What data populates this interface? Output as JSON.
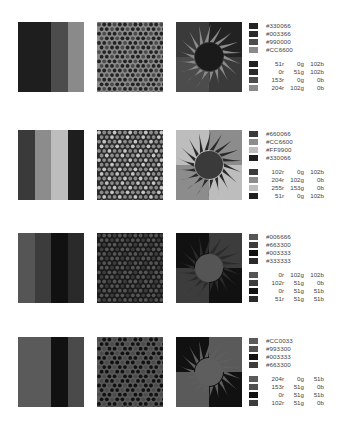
{
  "palettes": [
    {
      "top": 22,
      "stripes": [
        "#1e1e1e",
        "#1e1e1e",
        "#4c4c4c",
        "#8a8a8a"
      ],
      "pattern": {
        "bg": "#8a8a8a",
        "dot_a": "#222222",
        "dot_b": "#4a4a4a"
      },
      "sun": {
        "bg_tl": "#3a3a3a",
        "bg_tr": "#222222",
        "bg_bl": "#4c4c4c",
        "bg_br": "#3a3a3a",
        "rays": "#8a8a8a",
        "disc": "#1a1a1a"
      },
      "colors": [
        {
          "hex": "#330066",
          "r": "51r",
          "g": "0g",
          "b": "102b",
          "gray": "#222222"
        },
        {
          "hex": "#003366",
          "r": "0r",
          "g": "51g",
          "b": "102b",
          "gray": "#2a2a2a"
        },
        {
          "hex": "#990000",
          "r": "153r",
          "g": "0g",
          "b": "0b",
          "gray": "#4c4c4c"
        },
        {
          "hex": "#CC6600",
          "r": "204r",
          "g": "102g",
          "b": "0b",
          "gray": "#8a8a8a"
        }
      ]
    },
    {
      "top": 130,
      "stripes": [
        "#3a3a3a",
        "#8c8c8c",
        "#bdbdbd",
        "#1e1e1e"
      ],
      "pattern": {
        "bg": "#2a2a2a",
        "dot_a": "#8c8c8c",
        "dot_b": "#c4c4c4"
      },
      "sun": {
        "bg_tl": "#bdbdbd",
        "bg_tr": "#8c8c8c",
        "bg_bl": "#8c8c8c",
        "bg_br": "#bdbdbd",
        "rays": "#2a2a2a",
        "disc": "#3a3a3a"
      },
      "colors": [
        {
          "hex": "#660066",
          "r": "102r",
          "g": "0g",
          "b": "102b",
          "gray": "#3a3a3a"
        },
        {
          "hex": "#CC6600",
          "r": "204r",
          "g": "102g",
          "b": "0b",
          "gray": "#8c8c8c"
        },
        {
          "hex": "#FF9900",
          "r": "255r",
          "g": "153g",
          "b": "0b",
          "gray": "#bdbdbd"
        },
        {
          "hex": "#330066",
          "r": "51r",
          "g": "0g",
          "b": "102b",
          "gray": "#1e1e1e"
        }
      ]
    },
    {
      "top": 233,
      "stripes": [
        "#555555",
        "#3c3c3c",
        "#111111",
        "#2a2a2a"
      ],
      "pattern": {
        "bg": "#1a1a1a",
        "dot_a": "#555555",
        "dot_b": "#3c3c3c"
      },
      "sun": {
        "bg_tl": "#111111",
        "bg_tr": "#3c3c3c",
        "bg_bl": "#3c3c3c",
        "bg_br": "#111111",
        "rays": "#2a2a2a",
        "disc": "#555555"
      },
      "colors": [
        {
          "hex": "#006666",
          "r": "0r",
          "g": "102g",
          "b": "102b",
          "gray": "#555555"
        },
        {
          "hex": "#663300",
          "r": "102r",
          "g": "51g",
          "b": "0b",
          "gray": "#3c3c3c"
        },
        {
          "hex": "#003333",
          "r": "0r",
          "g": "51g",
          "b": "51b",
          "gray": "#111111"
        },
        {
          "hex": "#333333",
          "r": "51r",
          "g": "51g",
          "b": "51b",
          "gray": "#2a2a2a"
        }
      ]
    },
    {
      "top": 337,
      "stripes": [
        "#5a5a5a",
        "#5a5a5a",
        "#111111",
        "#4a4a4a"
      ],
      "pattern": {
        "bg": "#5a5a5a",
        "dot_a": "#111111",
        "dot_b": "#4a4a4a"
      },
      "sun": {
        "bg_tl": "#111111",
        "bg_tr": "#5a5a5a",
        "bg_bl": "#5a5a5a",
        "bg_br": "#111111",
        "rays": "#5e5e5e",
        "disc": "#5e5e5e"
      },
      "colors": [
        {
          "hex": "#CC0033",
          "r": "204r",
          "g": "0g",
          "b": "51b",
          "gray": "#5a5a5a"
        },
        {
          "hex": "#993300",
          "r": "153r",
          "g": "51g",
          "b": "0b",
          "gray": "#505050"
        },
        {
          "hex": "#003333",
          "r": "0r",
          "g": "51g",
          "b": "51b",
          "gray": "#111111"
        },
        {
          "hex": "#663300",
          "r": "102r",
          "g": "51g",
          "b": "0b",
          "gray": "#3c3c3c"
        }
      ]
    }
  ]
}
